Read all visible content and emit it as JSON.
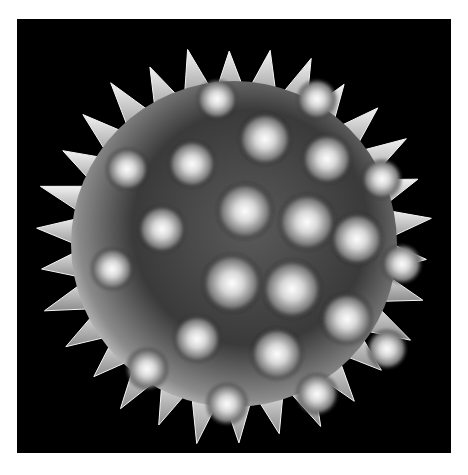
{
  "image": {
    "subject": "pollen-grain-sem-micrograph",
    "background_color": "#000000",
    "page_color": "#ffffff",
    "grain": {
      "center": [
        217,
        225
      ],
      "radius": 175,
      "spike_count": 30,
      "body_color_light": "#e8e8e8",
      "body_color_mid": "#9a9a9a",
      "body_color_dark": "#2a2a2a"
    },
    "bumps": [
      {
        "cx": 228,
        "cy": 192,
        "r": 24
      },
      {
        "cx": 290,
        "cy": 203,
        "r": 24
      },
      {
        "cx": 215,
        "cy": 264,
        "r": 25
      },
      {
        "cx": 275,
        "cy": 270,
        "r": 25
      },
      {
        "cx": 248,
        "cy": 120,
        "r": 22
      },
      {
        "cx": 310,
        "cy": 140,
        "r": 21
      },
      {
        "cx": 340,
        "cy": 220,
        "r": 22
      },
      {
        "cx": 330,
        "cy": 300,
        "r": 22
      },
      {
        "cx": 260,
        "cy": 335,
        "r": 22
      },
      {
        "cx": 180,
        "cy": 320,
        "r": 20
      },
      {
        "cx": 145,
        "cy": 210,
        "r": 20
      },
      {
        "cx": 175,
        "cy": 145,
        "r": 20
      },
      {
        "cx": 110,
        "cy": 150,
        "r": 18
      },
      {
        "cx": 95,
        "cy": 250,
        "r": 18
      },
      {
        "cx": 130,
        "cy": 350,
        "r": 18
      },
      {
        "cx": 210,
        "cy": 385,
        "r": 18
      },
      {
        "cx": 300,
        "cy": 375,
        "r": 18
      },
      {
        "cx": 370,
        "cy": 330,
        "r": 17
      },
      {
        "cx": 385,
        "cy": 245,
        "r": 17
      },
      {
        "cx": 365,
        "cy": 160,
        "r": 17
      },
      {
        "cx": 300,
        "cy": 80,
        "r": 17
      },
      {
        "cx": 200,
        "cy": 80,
        "r": 17
      }
    ]
  }
}
